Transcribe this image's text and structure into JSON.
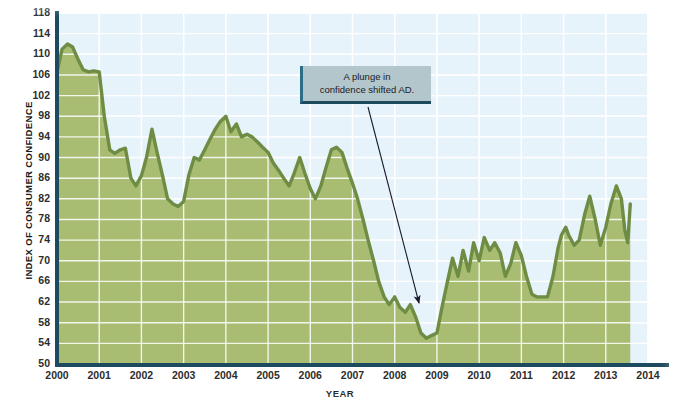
{
  "chart_data": {
    "type": "area",
    "title": "",
    "xlabel": "YEAR",
    "ylabel": "INDEX OF CONSUMER CONFIDENCE",
    "ylim": [
      50,
      118
    ],
    "xlim": [
      2000,
      2014
    ],
    "yticks": [
      50,
      54,
      58,
      62,
      66,
      70,
      74,
      78,
      82,
      86,
      90,
      94,
      98,
      102,
      106,
      110,
      114,
      118
    ],
    "xticks": [
      2000,
      2001,
      2002,
      2003,
      2004,
      2005,
      2006,
      2007,
      2008,
      2009,
      2010,
      2011,
      2012,
      2013,
      2014
    ],
    "grid": true,
    "legend": "none",
    "series": [
      {
        "name": "Index of Consumer Confidence",
        "fill_color": "#a8bd72",
        "line_color": "#6f8c45",
        "points": [
          [
            2000.0,
            106.5
          ],
          [
            2000.12,
            111.0
          ],
          [
            2000.25,
            112.0
          ],
          [
            2000.37,
            111.4
          ],
          [
            2000.5,
            109.0
          ],
          [
            2000.62,
            107.0
          ],
          [
            2000.75,
            106.6
          ],
          [
            2000.87,
            106.8
          ],
          [
            2001.0,
            106.6
          ],
          [
            2001.12,
            98.0
          ],
          [
            2001.25,
            91.5
          ],
          [
            2001.37,
            90.8
          ],
          [
            2001.5,
            91.5
          ],
          [
            2001.62,
            91.8
          ],
          [
            2001.75,
            86.0
          ],
          [
            2001.87,
            84.5
          ],
          [
            2002.0,
            86.5
          ],
          [
            2002.12,
            90.0
          ],
          [
            2002.25,
            95.5
          ],
          [
            2002.37,
            91.0
          ],
          [
            2002.5,
            86.5
          ],
          [
            2002.62,
            82.0
          ],
          [
            2002.75,
            81.0
          ],
          [
            2002.87,
            80.5
          ],
          [
            2003.0,
            81.5
          ],
          [
            2003.12,
            86.5
          ],
          [
            2003.25,
            90.0
          ],
          [
            2003.37,
            89.5
          ],
          [
            2003.5,
            91.5
          ],
          [
            2003.62,
            93.5
          ],
          [
            2003.75,
            95.5
          ],
          [
            2003.87,
            97.0
          ],
          [
            2004.0,
            98.0
          ],
          [
            2004.12,
            95.0
          ],
          [
            2004.25,
            96.5
          ],
          [
            2004.37,
            94.0
          ],
          [
            2004.5,
            94.5
          ],
          [
            2004.62,
            94.0
          ],
          [
            2004.75,
            93.0
          ],
          [
            2004.87,
            92.0
          ],
          [
            2005.0,
            91.0
          ],
          [
            2005.12,
            89.0
          ],
          [
            2005.25,
            87.5
          ],
          [
            2005.37,
            86.0
          ],
          [
            2005.5,
            84.5
          ],
          [
            2005.62,
            87.0
          ],
          [
            2005.75,
            90.0
          ],
          [
            2005.87,
            87.0
          ],
          [
            2006.0,
            84.0
          ],
          [
            2006.12,
            82.0
          ],
          [
            2006.25,
            84.5
          ],
          [
            2006.37,
            88.0
          ],
          [
            2006.5,
            91.5
          ],
          [
            2006.62,
            92.0
          ],
          [
            2006.75,
            91.0
          ],
          [
            2006.87,
            88.0
          ],
          [
            2007.0,
            85.0
          ],
          [
            2007.12,
            82.0
          ],
          [
            2007.25,
            78.0
          ],
          [
            2007.37,
            74.0
          ],
          [
            2007.5,
            70.0
          ],
          [
            2007.62,
            66.0
          ],
          [
            2007.75,
            63.0
          ],
          [
            2007.87,
            61.5
          ],
          [
            2008.0,
            63.0
          ],
          [
            2008.12,
            61.0
          ],
          [
            2008.25,
            60.0
          ],
          [
            2008.37,
            61.5
          ],
          [
            2008.5,
            59.0
          ],
          [
            2008.62,
            56.0
          ],
          [
            2008.75,
            55.0
          ],
          [
            2008.87,
            55.5
          ],
          [
            2009.0,
            56.0
          ],
          [
            2009.12,
            61.0
          ],
          [
            2009.25,
            66.0
          ],
          [
            2009.37,
            70.5
          ],
          [
            2009.5,
            67.0
          ],
          [
            2009.62,
            72.0
          ],
          [
            2009.75,
            68.0
          ],
          [
            2009.87,
            73.5
          ],
          [
            2010.0,
            70.0
          ],
          [
            2010.12,
            74.5
          ],
          [
            2010.25,
            72.0
          ],
          [
            2010.37,
            73.5
          ],
          [
            2010.5,
            71.5
          ],
          [
            2010.62,
            67.0
          ],
          [
            2010.75,
            69.5
          ],
          [
            2010.87,
            73.5
          ],
          [
            2011.0,
            71.0
          ],
          [
            2011.12,
            67.0
          ],
          [
            2011.25,
            63.5
          ],
          [
            2011.37,
            63.0
          ],
          [
            2011.5,
            63.0
          ],
          [
            2011.62,
            63.0
          ],
          [
            2011.75,
            67.0
          ],
          [
            2011.87,
            72.5
          ],
          [
            2011.95,
            75.0
          ],
          [
            2012.05,
            76.5
          ],
          [
            2012.12,
            75.0
          ],
          [
            2012.25,
            73.0
          ],
          [
            2012.37,
            74.0
          ],
          [
            2012.5,
            79.0
          ],
          [
            2012.62,
            82.5
          ],
          [
            2012.75,
            78.0
          ],
          [
            2012.87,
            73.0
          ],
          [
            2013.0,
            76.5
          ],
          [
            2013.12,
            81.0
          ],
          [
            2013.25,
            84.5
          ],
          [
            2013.37,
            82.0
          ],
          [
            2013.45,
            76.0
          ],
          [
            2013.52,
            73.5
          ],
          [
            2013.58,
            81.0
          ]
        ]
      }
    ],
    "annotations": [
      {
        "text": "A plunge in confidence shifted AD.",
        "line1": "A plunge in",
        "line2": "confidence shifted AD.",
        "points_to_year": 2008.6,
        "points_to_value": 57
      }
    ],
    "colors": {
      "plot_background": "#e6f3fa",
      "area_fill": "#a8bd72",
      "line": "#6f8c45",
      "gridline": "#ffffff",
      "axis": "#1d4a5e",
      "annotation_box": "#b3c6cc",
      "annotation_border": "#1d4a5e"
    }
  }
}
